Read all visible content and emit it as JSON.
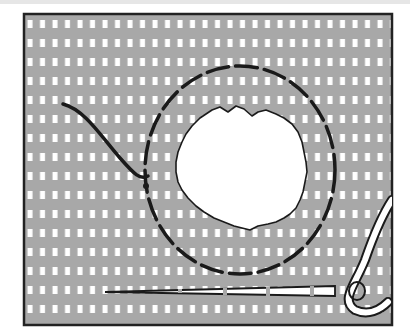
{
  "illustration": {
    "subject": "darning a hole in fabric",
    "fabric_color": "#a8a8a8",
    "grid_color": "#ffffff",
    "frame_color": "#222222",
    "stitch_color": "#1a1a1a",
    "hole_color": "#ffffff",
    "elements": [
      "fabric-panel",
      "hole",
      "dashed-stitch-ring",
      "thread-tail",
      "needle",
      "thread-loop"
    ]
  }
}
